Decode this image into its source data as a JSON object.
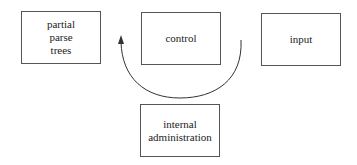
{
  "diagram": {
    "boxes": [
      {
        "id": "partial-parse-trees",
        "label": "partial\nparse\ntrees"
      },
      {
        "id": "control",
        "label": "control"
      },
      {
        "id": "input",
        "label": "input"
      },
      {
        "id": "internal-administration",
        "label": "internal\nadministration"
      }
    ],
    "edges": [
      {
        "from": "control",
        "to": "control",
        "style": "curved-arrow",
        "description": "circular arrow looping beneath control box, arrowhead pointing up-left"
      }
    ]
  }
}
